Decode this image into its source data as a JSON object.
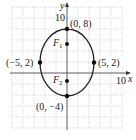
{
  "diagram": {
    "type": "ellipse-graph",
    "axes": {
      "x_label": "x",
      "y_label": "y",
      "x_tick_label": "10",
      "y_tick_label": "10",
      "grid_step": 2
    },
    "ellipse": {
      "center": [
        0,
        2
      ],
      "semi_major": 6,
      "semi_minor": 5,
      "orientation": "vertical",
      "stroke_color": "#222222"
    },
    "points": [
      {
        "id": "top-vertex",
        "label": "(0, 8)",
        "x": 0,
        "y": 8
      },
      {
        "id": "bottom-vertex",
        "label": "(0, −4)",
        "x": 0,
        "y": -4
      },
      {
        "id": "left-covertex",
        "label": "(−5, 2)",
        "x": -5,
        "y": 2
      },
      {
        "id": "right-covertex",
        "label": "(5, 2)",
        "x": 5,
        "y": 2
      }
    ],
    "foci": [
      {
        "id": "F1",
        "label": "F",
        "sub": "1",
        "x": 0,
        "y": 5.3
      },
      {
        "id": "F2",
        "label": "F",
        "sub": "2",
        "x": 0,
        "y": -1.3
      }
    ],
    "colors": {
      "grid": "#bdbdbd",
      "axis": "#333333",
      "curve": "#222222",
      "point": "#111111"
    }
  }
}
